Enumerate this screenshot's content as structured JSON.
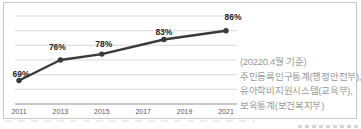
{
  "chart_data": {
    "type": "line",
    "title": "",
    "xlabel": "",
    "ylabel": "",
    "x": [
      2011,
      2013,
      2015,
      2018,
      2021
    ],
    "values": [
      69,
      76,
      78,
      83,
      86
    ],
    "point_labels": [
      "69%",
      "76%",
      "78%",
      "83%",
      "86%"
    ],
    "x_ticks": [
      "2011",
      "2013",
      "2015",
      "2017",
      "2019",
      "2021"
    ],
    "xlim": [
      2011,
      2021
    ],
    "ylim": [
      61,
      91
    ],
    "gridline_values": [
      66,
      71,
      76,
      81,
      86,
      91
    ],
    "grid": true,
    "legend": "none",
    "marker": "circle",
    "line_color": "#3a3a3a"
  },
  "annotation": {
    "lines": [
      "(20220.4월 기준)",
      "주민등록인구통계(행정안전부),",
      "유아학비지원시스템(교육부),",
      "보육통계(보건복지부)"
    ]
  },
  "colors": {
    "line": "#3a3a3a",
    "grid": "#d9d9d9",
    "axis": "#8f8f8f",
    "point_label": "#262626",
    "tick_label": "#595959",
    "annotation_text": "#9a9a9a",
    "panel_border": "#c9c9c9",
    "background": "#ffffff"
  }
}
